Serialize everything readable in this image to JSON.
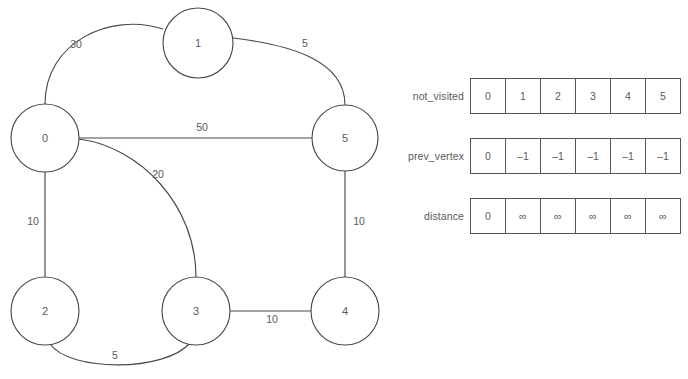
{
  "graph": {
    "nodes": [
      {
        "id": "0",
        "label": "0",
        "cx": 45,
        "cy": 138,
        "r": 34
      },
      {
        "id": "1",
        "label": "1",
        "cx": 198,
        "cy": 43,
        "r": 35
      },
      {
        "id": "2",
        "label": "2",
        "cx": 45,
        "cy": 311,
        "r": 34
      },
      {
        "id": "3",
        "label": "3",
        "cx": 196,
        "cy": 311,
        "r": 34
      },
      {
        "id": "4",
        "label": "4",
        "cx": 345,
        "cy": 311,
        "r": 34
      },
      {
        "id": "5",
        "label": "5",
        "cx": 345,
        "cy": 138,
        "r": 33
      }
    ],
    "edges": [
      {
        "from": "0",
        "to": "1",
        "weight": "30",
        "lx": 76,
        "ly": 45
      },
      {
        "from": "1",
        "to": "5",
        "weight": "5",
        "lx": 305,
        "ly": 44
      },
      {
        "from": "0",
        "to": "5",
        "weight": "50",
        "lx": 202,
        "ly": 128
      },
      {
        "from": "0",
        "to": "3",
        "weight": "20",
        "lx": 158,
        "ly": 175
      },
      {
        "from": "0",
        "to": "2",
        "weight": "10",
        "lx": 33,
        "ly": 222
      },
      {
        "from": "5",
        "to": "4",
        "weight": "10",
        "lx": 359,
        "ly": 222
      },
      {
        "from": "3",
        "to": "4",
        "weight": "10",
        "lx": 272,
        "ly": 320
      },
      {
        "from": "2",
        "to": "3",
        "weight": "5",
        "lx": 115,
        "ly": 356
      }
    ],
    "colors": {
      "stroke": "#4a4a4a",
      "node_fill": "#ffffff",
      "text": "#5a5a5a"
    }
  },
  "arrays": [
    {
      "name": "not_visited",
      "label": "not_visited",
      "cells": [
        "0",
        "1",
        "2",
        "3",
        "4",
        "5"
      ]
    },
    {
      "name": "prev_vertex",
      "label": "prev_vertex",
      "cells": [
        "0",
        "–1",
        "–1",
        "–1",
        "–1",
        "–1"
      ]
    },
    {
      "name": "distance",
      "label": "distance",
      "cells": [
        "0",
        "∞",
        "∞",
        "∞",
        "∞",
        "∞"
      ]
    }
  ],
  "top_caption_fragment": ""
}
